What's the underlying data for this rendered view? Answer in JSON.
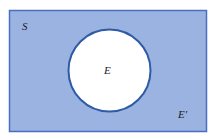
{
  "diagram": {
    "type": "venn",
    "universal_set": {
      "label": "S",
      "fill": "#9bb3e0",
      "border": "#4a6fc0"
    },
    "event": {
      "label": "E",
      "fill": "#ffffff",
      "border": "#2f5aa8"
    },
    "complement": {
      "label": "E'"
    }
  }
}
